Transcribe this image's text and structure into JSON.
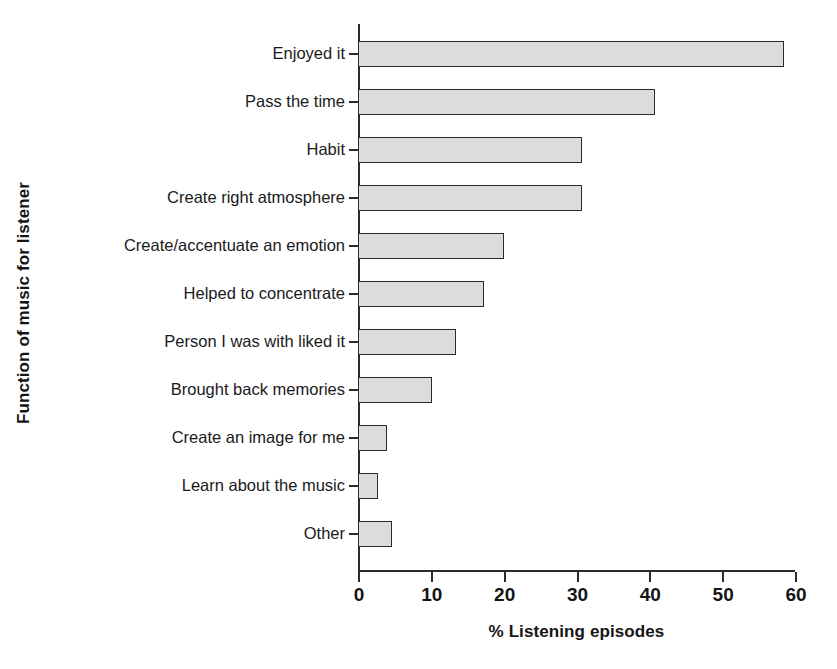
{
  "chart_data": {
    "type": "bar",
    "orientation": "horizontal",
    "title": "",
    "xlabel": "% Listening episodes",
    "ylabel": "Function of music for listener",
    "categories": [
      "Enjoyed it",
      "Pass the time",
      "Habit",
      "Create right atmosphere",
      "Create/accentuate an emotion",
      "Helped to concentrate",
      "Person I was with liked it",
      "Brought back memories",
      "Create an image for me",
      "Learn about the music",
      "Other"
    ],
    "values": [
      58.5,
      40.8,
      30.7,
      30.7,
      20.0,
      17.3,
      13.5,
      10.2,
      4.0,
      2.7,
      4.7
    ],
    "xlim": [
      0,
      60
    ],
    "xticks": [
      0,
      10,
      20,
      30,
      40,
      50,
      60
    ],
    "xtick_labels": [
      "0",
      "10",
      "20",
      "30",
      "40",
      "50",
      "60"
    ],
    "grid": false,
    "legend": null,
    "bar_fill_color": "#dcdcdc",
    "bar_edge_color": "#2b2b2b",
    "axis_color": "#2b2b2b",
    "background_color": "#ffffff"
  }
}
